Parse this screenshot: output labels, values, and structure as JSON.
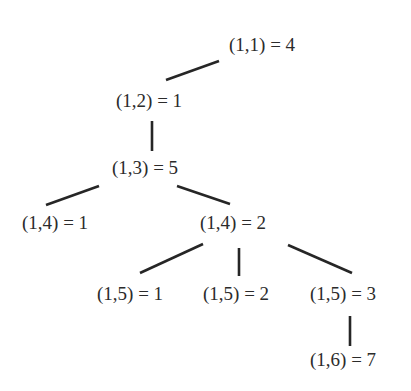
{
  "diagram": {
    "type": "tree",
    "colors": {
      "background": "#ffffff",
      "text": "#2b2b2b",
      "edge": "#262626"
    },
    "nodes": [
      {
        "id": "n1",
        "label": "(1,1) = 4",
        "x": 229,
        "y": 34
      },
      {
        "id": "n2",
        "label": "(1,2) = 1",
        "x": 116,
        "y": 90
      },
      {
        "id": "n3",
        "label": "(1,3) = 5",
        "x": 112,
        "y": 157
      },
      {
        "id": "n4a",
        "label": "(1,4) = 1",
        "x": 22,
        "y": 212
      },
      {
        "id": "n4b",
        "label": "(1,4) = 2",
        "x": 200,
        "y": 212
      },
      {
        "id": "n5a",
        "label": "(1,5) = 1",
        "x": 97,
        "y": 283
      },
      {
        "id": "n5b",
        "label": "(1,5) = 2",
        "x": 203,
        "y": 283
      },
      {
        "id": "n5c",
        "label": "(1,5) = 3",
        "x": 310,
        "y": 283
      },
      {
        "id": "n6",
        "label": "(1,6) = 7",
        "x": 310,
        "y": 349
      }
    ],
    "edges": [
      {
        "from": "n1",
        "to": "n2",
        "x1": 219,
        "y1": 61,
        "x2": 166,
        "y2": 80
      },
      {
        "from": "n2",
        "to": "n3",
        "x1": 152,
        "y1": 121,
        "x2": 152,
        "y2": 151
      },
      {
        "from": "n3",
        "to": "n4a",
        "x1": 99,
        "y1": 186,
        "x2": 46,
        "y2": 205
      },
      {
        "from": "n3",
        "to": "n4b",
        "x1": 177,
        "y1": 186,
        "x2": 230,
        "y2": 204
      },
      {
        "from": "n4b",
        "to": "n5a",
        "x1": 203,
        "y1": 244,
        "x2": 140,
        "y2": 273
      },
      {
        "from": "n4b",
        "to": "n5b",
        "x1": 239,
        "y1": 248,
        "x2": 239,
        "y2": 276
      },
      {
        "from": "n4b",
        "to": "n5c",
        "x1": 288,
        "y1": 245,
        "x2": 352,
        "y2": 273
      },
      {
        "from": "n5c",
        "to": "n6",
        "x1": 350,
        "y1": 316,
        "x2": 350,
        "y2": 346
      }
    ]
  }
}
